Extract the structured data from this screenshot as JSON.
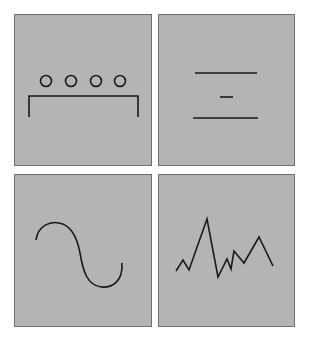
{
  "colors": {
    "background": "#ffffff",
    "panel_fill": "#b4b4b4",
    "panel_border": "#6f6f6f",
    "stroke": "#1a1a1a"
  },
  "panels": [
    {
      "id": "p1",
      "name": "panel-circles-bracket",
      "glyph": "four circles above a bracket"
    },
    {
      "id": "p2",
      "name": "panel-horizontal-lines",
      "glyph": "long line, short dash, long line"
    },
    {
      "id": "p3",
      "name": "panel-sine-wave",
      "glyph": "smooth S-shaped sine curve"
    },
    {
      "id": "p4",
      "name": "panel-zigzag",
      "glyph": "jagged polyline"
    }
  ]
}
